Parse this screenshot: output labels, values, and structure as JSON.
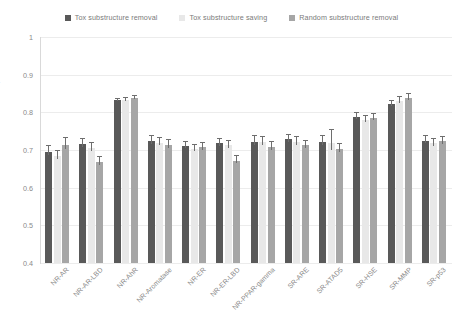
{
  "chart_data": {
    "type": "bar",
    "title": "",
    "xlabel": "",
    "ylabel": "ROC-AUC, %",
    "ylim": [
      0.4,
      1.0
    ],
    "yticks": [
      "1",
      "0.9",
      "0.8",
      "0.7",
      "0.6",
      "0.5",
      "0.4"
    ],
    "ytick_values": [
      1,
      0.9,
      0.8,
      0.7,
      0.6,
      0.5,
      0.4
    ],
    "grid": true,
    "legend_position": "top-center",
    "categories": [
      "NR-AR",
      "NR-AR-LBD",
      "NR-AhR",
      "NR-Aromatase",
      "NR-ER",
      "NR-ER-LBD",
      "NR-PPAR-gamma",
      "SR-ARE",
      "SR-ATAD5",
      "SR-HSE",
      "SR-MMP",
      "SR-p53"
    ],
    "series": [
      {
        "name": "Tox substructure removal",
        "color": "#595959",
        "values": [
          0.695,
          0.715,
          0.832,
          0.723,
          0.71,
          0.718,
          0.722,
          0.728,
          0.722,
          0.788,
          0.822,
          0.725
        ],
        "errors": [
          0.018,
          0.016,
          0.006,
          0.016,
          0.013,
          0.015,
          0.018,
          0.015,
          0.017,
          0.013,
          0.012,
          0.016
        ]
      },
      {
        "name": "Tox substructure saving",
        "color": "#e8e8e8",
        "values": [
          0.683,
          0.705,
          0.833,
          0.719,
          0.703,
          0.712,
          0.72,
          0.72,
          0.718,
          0.78,
          0.83,
          0.718
        ],
        "errors": [
          0.017,
          0.017,
          0.007,
          0.015,
          0.013,
          0.015,
          0.016,
          0.016,
          0.038,
          0.014,
          0.014,
          0.014
        ]
      },
      {
        "name": "Random substructure removal",
        "color": "#a6a6a6",
        "values": [
          0.713,
          0.667,
          0.838,
          0.713,
          0.707,
          0.672,
          0.708,
          0.712,
          0.703,
          0.785,
          0.838,
          0.723
        ],
        "errors": [
          0.021,
          0.018,
          0.007,
          0.015,
          0.013,
          0.014,
          0.016,
          0.014,
          0.016,
          0.014,
          0.013,
          0.015
        ]
      }
    ]
  }
}
